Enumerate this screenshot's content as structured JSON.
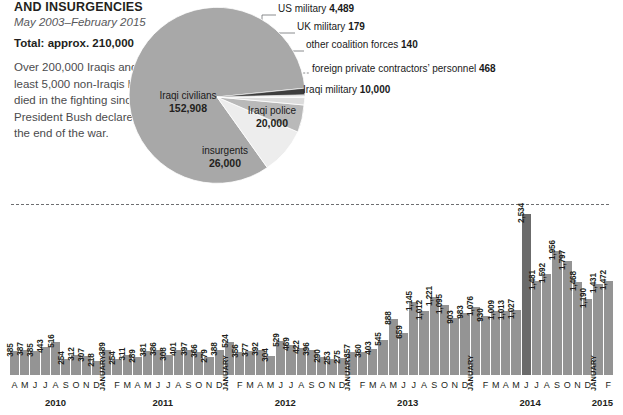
{
  "header": {
    "title": "AND INSURGENCIES",
    "daterange": "May 2003–February 2015",
    "total": "Total: approx. 210,000",
    "description": "Over 200,000 Iraqis and at least 5,000 non-Iraqis have died in the fighting since President Bush declared the end of the war."
  },
  "callout": {
    "text": "nationwide attacks in one day."
  },
  "pie": {
    "slices": [
      {
        "name": "Iraqi civilians",
        "value": "152,908",
        "number": 152908,
        "color": "#a8a8a8"
      },
      {
        "name": "insurgents",
        "value": "26,000",
        "number": 26000,
        "color": "#ededed"
      },
      {
        "name": "Iraqi police",
        "value": "20,000",
        "number": 20000,
        "color": "#b9b9b9"
      },
      {
        "name": "Iraqi military",
        "value": "10,000",
        "number": 10000,
        "color": "#dcdcdc"
      },
      {
        "name": "foreign private contractors' personnel",
        "value": "468",
        "number": 468,
        "color": "#f2f2f2"
      },
      {
        "name": "other coalition forces",
        "value": "140",
        "number": 140,
        "color": "#8c8c8c"
      },
      {
        "name": "UK military",
        "value": "179",
        "number": 179,
        "color": "#6f6f6f"
      },
      {
        "name": "US military",
        "value": "4,489",
        "number": 4489,
        "color": "#3d3d3d"
      }
    ],
    "labels": {
      "us_military": {
        "name": "US military",
        "value": "4,489"
      },
      "uk_military": {
        "name": "UK military",
        "value": "179"
      },
      "other_coalition": {
        "name": "other coalition forces",
        "value": "140"
      },
      "contractors": {
        "name": "foreign private contractors’ personnel",
        "value": "468"
      },
      "iraqi_military": {
        "name": "Iraqi military",
        "value": "10,000"
      },
      "iraqi_police": {
        "name": "Iraqi police",
        "value": "20,000"
      },
      "insurgents": {
        "name": "insurgents",
        "value": "26,000"
      },
      "iraqi_civilians": {
        "name": "Iraqi civilians",
        "value": "152,908"
      }
    }
  },
  "chart_data": {
    "type": "bar",
    "title": "",
    "xlabel": "",
    "ylabel": "",
    "ylim": [
      0,
      2534
    ],
    "grid": false,
    "legend": "none",
    "bar_color": "#949494",
    "peak_color": "#6b6b6b",
    "years": [
      {
        "year": "2010",
        "count": 9
      },
      {
        "year": "2011",
        "count": 12
      },
      {
        "year": "2012",
        "count": 12
      },
      {
        "year": "2013",
        "count": 12
      },
      {
        "year": "2014",
        "count": 12
      },
      {
        "year": "2015",
        "count": 2
      }
    ],
    "bars": [
      {
        "month": "A",
        "year": "2010",
        "value": 385,
        "label": "385"
      },
      {
        "month": "M",
        "year": "2010",
        "value": 387,
        "label": "387"
      },
      {
        "month": "J",
        "year": "2010",
        "value": 385,
        "label": "385"
      },
      {
        "month": "J",
        "year": "2010",
        "value": 443,
        "label": "443"
      },
      {
        "month": "A",
        "year": "2010",
        "value": 516,
        "label": "516"
      },
      {
        "month": "S",
        "year": "2010",
        "value": 254,
        "label": "254"
      },
      {
        "month": "O",
        "year": "2010",
        "value": 312,
        "label": "312"
      },
      {
        "month": "N",
        "year": "2010",
        "value": 307,
        "label": "307"
      },
      {
        "month": "D",
        "year": "2010",
        "value": 218,
        "label": "218"
      },
      {
        "month": "",
        "year": "2011",
        "value": 389,
        "label": "389",
        "january": "JANUARY"
      },
      {
        "month": "F",
        "year": "2011",
        "value": 254,
        "label": "254"
      },
      {
        "month": "M",
        "year": "2011",
        "value": 311,
        "label": "311"
      },
      {
        "month": "A",
        "year": "2011",
        "value": 289,
        "label": "289"
      },
      {
        "month": "M",
        "year": "2011",
        "value": 381,
        "label": "381"
      },
      {
        "month": "J",
        "year": "2011",
        "value": 386,
        "label": "386"
      },
      {
        "month": "J",
        "year": "2011",
        "value": 308,
        "label": "308"
      },
      {
        "month": "A",
        "year": "2011",
        "value": 401,
        "label": "401"
      },
      {
        "month": "S",
        "year": "2011",
        "value": 397,
        "label": "397"
      },
      {
        "month": "O",
        "year": "2011",
        "value": 366,
        "label": "366"
      },
      {
        "month": "N",
        "year": "2011",
        "value": 279,
        "label": "279"
      },
      {
        "month": "D",
        "year": "2011",
        "value": 388,
        "label": "388"
      },
      {
        "month": "",
        "year": "2012",
        "value": 524,
        "label": "524",
        "january": "JANUARY"
      },
      {
        "month": "F",
        "year": "2012",
        "value": 356,
        "label": "356"
      },
      {
        "month": "M",
        "year": "2012",
        "value": 377,
        "label": "377"
      },
      {
        "month": "A",
        "year": "2012",
        "value": 392,
        "label": "392"
      },
      {
        "month": "M",
        "year": "2012",
        "value": 304,
        "label": "304"
      },
      {
        "month": "J",
        "year": "2012",
        "value": 529,
        "label": "529"
      },
      {
        "month": "J",
        "year": "2012",
        "value": 469,
        "label": "469"
      },
      {
        "month": "A",
        "year": "2012",
        "value": 422,
        "label": "422"
      },
      {
        "month": "S",
        "year": "2012",
        "value": 396,
        "label": "396"
      },
      {
        "month": "O",
        "year": "2012",
        "value": 290,
        "label": "290"
      },
      {
        "month": "N",
        "year": "2012",
        "value": 253,
        "label": "253"
      },
      {
        "month": "D",
        "year": "2012",
        "value": 275,
        "label": "275"
      },
      {
        "month": "",
        "year": "2013",
        "value": 357,
        "label": "357",
        "january": "JANUARY"
      },
      {
        "month": "F",
        "year": "2013",
        "value": 360,
        "label": "360"
      },
      {
        "month": "M",
        "year": "2013",
        "value": 403,
        "label": "403"
      },
      {
        "month": "A",
        "year": "2013",
        "value": 545,
        "label": "545"
      },
      {
        "month": "M",
        "year": "2013",
        "value": 888,
        "label": "888"
      },
      {
        "month": "J",
        "year": "2013",
        "value": 659,
        "label": "659"
      },
      {
        "month": "J",
        "year": "2013",
        "value": 1145,
        "label": "1,145"
      },
      {
        "month": "A",
        "year": "2013",
        "value": 1012,
        "label": "1,012"
      },
      {
        "month": "S",
        "year": "2013",
        "value": 1221,
        "label": "1,221"
      },
      {
        "month": "O",
        "year": "2013",
        "value": 1095,
        "label": "1,095"
      },
      {
        "month": "N",
        "year": "2013",
        "value": 903,
        "label": "903"
      },
      {
        "month": "D",
        "year": "2013",
        "value": 983,
        "label": "983"
      },
      {
        "month": "",
        "year": "2014",
        "value": 1076,
        "label": "1,076",
        "january": "JANUARY"
      },
      {
        "month": "F",
        "year": "2014",
        "value": 930,
        "label": "930"
      },
      {
        "month": "M",
        "year": "2014",
        "value": 1009,
        "label": "1,009"
      },
      {
        "month": "A",
        "year": "2014",
        "value": 1013,
        "label": "1,013"
      },
      {
        "month": "M",
        "year": "2014",
        "value": 1027,
        "label": "1,027"
      },
      {
        "month": "J",
        "year": "2014",
        "value": 2534,
        "label": "2,534",
        "peak": true
      },
      {
        "month": "J",
        "year": "2014",
        "value": 1481,
        "label": "1,481"
      },
      {
        "month": "A",
        "year": "2014",
        "value": 1592,
        "label": "1,592"
      },
      {
        "month": "S",
        "year": "2014",
        "value": 1956,
        "label": "1,956"
      },
      {
        "month": "O",
        "year": "2014",
        "value": 1797,
        "label": "1,797"
      },
      {
        "month": "N",
        "year": "2014",
        "value": 1468,
        "label": "1,468"
      },
      {
        "month": "D",
        "year": "2014",
        "value": 1190,
        "label": "1,190"
      },
      {
        "month": "",
        "year": "2015",
        "value": 1431,
        "label": "1,431",
        "january": "JANUARY"
      },
      {
        "month": "F",
        "year": "2015",
        "value": 1472,
        "label": "1,472"
      }
    ]
  }
}
